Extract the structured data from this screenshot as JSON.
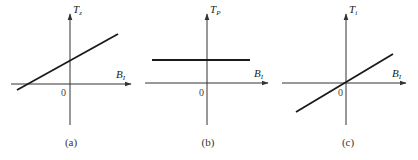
{
  "panels": [
    {
      "id": "a",
      "caption": "(a)",
      "y_axis_label": {
        "main": "T",
        "sub": "z"
      },
      "x_axis_label": {
        "main": "B",
        "sub": "I"
      },
      "origin_label": "0",
      "description": "Straight line with positive slope and positive y-intercept"
    },
    {
      "id": "b",
      "caption": "(b)",
      "y_axis_label": {
        "main": "T",
        "sub": "P"
      },
      "x_axis_label": {
        "main": "B",
        "sub": "I"
      },
      "origin_label": "0",
      "description": "Horizontal line at constant positive value"
    },
    {
      "id": "c",
      "caption": "(c)",
      "y_axis_label": {
        "main": "T",
        "sub": "i"
      },
      "x_axis_label": {
        "main": "B",
        "sub": "I"
      },
      "origin_label": "0",
      "description": "Straight line with positive slope through the origin"
    }
  ],
  "colors": {
    "axis": "#333333",
    "curve": "#1a1a1a",
    "background": "#ffffff"
  }
}
